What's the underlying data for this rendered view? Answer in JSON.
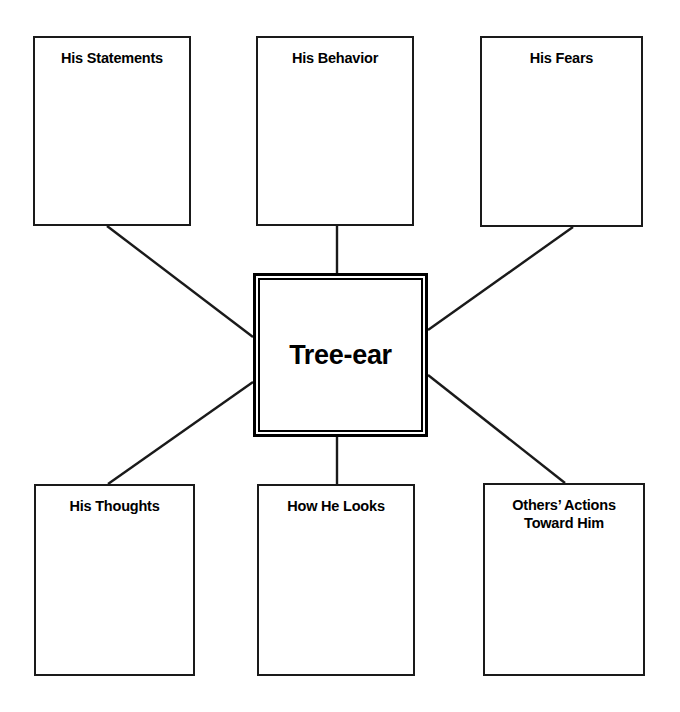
{
  "diagram": {
    "center": {
      "label": "Tree-ear",
      "x": 253,
      "y": 273,
      "width": 175,
      "height": 164
    },
    "nodes": [
      {
        "id": "his-statements",
        "label": "His Statements",
        "x": 33,
        "y": 36,
        "width": 158,
        "height": 190
      },
      {
        "id": "his-behavior",
        "label": "His Behavior",
        "x": 256,
        "y": 36,
        "width": 158,
        "height": 190
      },
      {
        "id": "his-fears",
        "label": "His Fears",
        "x": 480,
        "y": 36,
        "width": 163,
        "height": 191
      },
      {
        "id": "his-thoughts",
        "label": "His Thoughts",
        "x": 34,
        "y": 484,
        "width": 161,
        "height": 192
      },
      {
        "id": "how-he-looks",
        "label": "How He Looks",
        "x": 257,
        "y": 484,
        "width": 158,
        "height": 192
      },
      {
        "id": "others-actions-toward-him",
        "label": "Others’ Actions\nToward Him",
        "x": 483,
        "y": 483,
        "width": 162,
        "height": 193
      }
    ],
    "connectors": [
      {
        "id": "connector-his-statements",
        "from": "his-statements",
        "x1": 107,
        "y1": 226,
        "x2": 253,
        "y2": 337
      },
      {
        "id": "connector-his-behavior",
        "from": "his-behavior",
        "x1": 337,
        "y1": 226,
        "x2": 337,
        "y2": 273
      },
      {
        "id": "connector-his-fears",
        "from": "his-fears",
        "x1": 573,
        "y1": 227,
        "x2": 428,
        "y2": 330
      },
      {
        "id": "connector-his-thoughts",
        "from": "his-thoughts",
        "x1": 253,
        "y1": 382,
        "x2": 108,
        "y2": 484
      },
      {
        "id": "connector-how-he-looks",
        "from": "how-he-looks",
        "x1": 337,
        "y1": 437,
        "x2": 337,
        "y2": 484
      },
      {
        "id": "connector-others-actions",
        "from": "others-actions-toward-him",
        "x1": 428,
        "y1": 375,
        "x2": 565,
        "y2": 483
      }
    ],
    "colors": {
      "background": "#ffffff",
      "stroke": "#1a1a1a",
      "center_stroke": "#000000",
      "text": "#000000"
    }
  }
}
